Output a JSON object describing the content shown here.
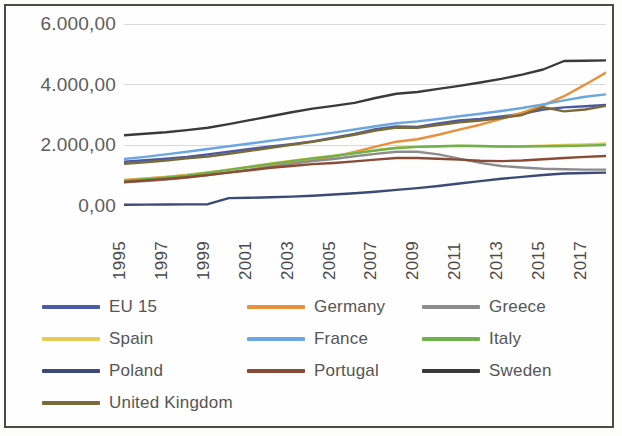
{
  "chart_data": {
    "type": "line",
    "title": "",
    "xlabel": "",
    "ylabel": "",
    "ylim": [
      0,
      6000
    ],
    "yticks": [
      0,
      2000,
      4000,
      6000
    ],
    "ytick_labels": [
      "0,00",
      "2.000,00",
      "4.000,00",
      "6.000,00"
    ],
    "grid": true,
    "legend_position": "bottom",
    "x": [
      1995,
      1996,
      1997,
      1998,
      1999,
      2000,
      2001,
      2002,
      2003,
      2004,
      2005,
      2006,
      2007,
      2008,
      2009,
      2010,
      2011,
      2012,
      2013,
      2014,
      2015,
      2016,
      2017,
      2018
    ],
    "xtick_labels": [
      "1995",
      "1997",
      "1999",
      "2001",
      "2003",
      "2005",
      "2007",
      "2009",
      "2011",
      "2013",
      "2015",
      "2017"
    ],
    "series": [
      {
        "name": "EU 15",
        "color": "#4a5aa8",
        "values": [
          1460,
          1510,
          1560,
          1620,
          1700,
          1790,
          1880,
          1960,
          2040,
          2130,
          2250,
          2380,
          2530,
          2620,
          2610,
          2720,
          2820,
          2870,
          2950,
          3040,
          3180,
          3250,
          3290,
          3330
        ]
      },
      {
        "name": "Germany",
        "color": "#e8903c",
        "values": [
          860,
          910,
          960,
          1020,
          1100,
          1190,
          1290,
          1360,
          1420,
          1510,
          1630,
          1780,
          1960,
          2120,
          2200,
          2350,
          2520,
          2680,
          2870,
          3080,
          3320,
          3620,
          4000,
          4400
        ]
      },
      {
        "name": "Greece",
        "color": "#8c8c8c",
        "values": [
          780,
          820,
          870,
          940,
          1020,
          1110,
          1200,
          1300,
          1390,
          1480,
          1550,
          1640,
          1720,
          1790,
          1790,
          1700,
          1560,
          1420,
          1320,
          1270,
          1230,
          1210,
          1200,
          1200
        ]
      },
      {
        "name": "Spain",
        "color": "#e8cb54",
        "values": [
          840,
          890,
          950,
          1020,
          1110,
          1200,
          1300,
          1400,
          1490,
          1580,
          1660,
          1750,
          1840,
          1920,
          1950,
          1960,
          1980,
          1970,
          1960,
          1970,
          1990,
          2010,
          2030,
          2060
        ]
      },
      {
        "name": "France",
        "color": "#6aa6e0",
        "values": [
          1550,
          1620,
          1700,
          1790,
          1880,
          1970,
          2060,
          2150,
          2240,
          2330,
          2420,
          2520,
          2630,
          2730,
          2790,
          2870,
          2960,
          3040,
          3130,
          3230,
          3350,
          3480,
          3600,
          3680
        ]
      },
      {
        "name": "Italy",
        "color": "#6fb14a",
        "values": [
          830,
          880,
          940,
          1010,
          1100,
          1190,
          1290,
          1390,
          1480,
          1570,
          1650,
          1740,
          1830,
          1910,
          1950,
          1970,
          1990,
          1980,
          1960,
          1960,
          1970,
          1980,
          1990,
          2010
        ]
      },
      {
        "name": "Poland",
        "color": "#3c4a78",
        "values": [
          40,
          45,
          50,
          55,
          60,
          260,
          270,
          290,
          310,
          340,
          380,
          420,
          470,
          530,
          590,
          660,
          740,
          820,
          900,
          960,
          1020,
          1070,
          1090,
          1100
        ]
      },
      {
        "name": "Portugal",
        "color": "#8a4b35",
        "values": [
          790,
          840,
          890,
          950,
          1020,
          1100,
          1180,
          1260,
          1320,
          1380,
          1420,
          1470,
          1530,
          1580,
          1580,
          1560,
          1530,
          1490,
          1480,
          1500,
          1540,
          1580,
          1620,
          1650
        ]
      },
      {
        "name": "Sweden",
        "color": "#3a3a3a",
        "values": [
          2330,
          2380,
          2430,
          2500,
          2580,
          2700,
          2830,
          2960,
          3090,
          3210,
          3300,
          3400,
          3560,
          3700,
          3760,
          3860,
          3960,
          4070,
          4190,
          4330,
          4500,
          4780,
          4790,
          4800
        ]
      },
      {
        "name": "United Kingdom",
        "color": "#7a6a3a",
        "values": [
          1390,
          1440,
          1500,
          1570,
          1630,
          1720,
          1820,
          1920,
          2020,
          2120,
          2230,
          2350,
          2490,
          2590,
          2580,
          2670,
          2760,
          2820,
          2900,
          3000,
          3260,
          3120,
          3180,
          3300
        ]
      }
    ]
  },
  "legend": {
    "rows": [
      [
        {
          "label": "EU 15",
          "color": "#4a5aa8"
        },
        {
          "label": "Germany",
          "color": "#e8903c"
        },
        {
          "label": "Greece",
          "color": "#8c8c8c"
        }
      ],
      [
        {
          "label": "Spain",
          "color": "#e8cb54"
        },
        {
          "label": "France",
          "color": "#6aa6e0"
        },
        {
          "label": "Italy",
          "color": "#6fb14a"
        }
      ],
      [
        {
          "label": "Poland",
          "color": "#3c4a78"
        },
        {
          "label": "Portugal",
          "color": "#8a4b35"
        },
        {
          "label": "Sweden",
          "color": "#3a3a3a"
        }
      ],
      [
        {
          "label": "United Kingdom",
          "color": "#7a6a3a"
        }
      ]
    ]
  }
}
